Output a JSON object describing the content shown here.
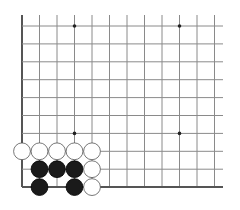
{
  "board": {
    "columns": 12,
    "rows": 10,
    "origin_x": 22,
    "origin_y": 26,
    "spacing_x": 17.5,
    "spacing_y": 17.9,
    "top_extend_y": 15,
    "right_extend_x": 223,
    "edges": {
      "left": true,
      "bottom": true,
      "top": false,
      "right": false
    },
    "line_color": "#8a8a8a",
    "edge_color": "#555555",
    "star_points": [
      {
        "col": 3,
        "row": 0
      },
      {
        "col": 9,
        "row": 0
      },
      {
        "col": 3,
        "row": 6
      },
      {
        "col": 9,
        "row": 6
      }
    ]
  },
  "stones": [
    {
      "color": "white",
      "col": 0,
      "row": 7
    },
    {
      "color": "white",
      "col": 1,
      "row": 7
    },
    {
      "color": "white",
      "col": 2,
      "row": 7
    },
    {
      "color": "white",
      "col": 3,
      "row": 7
    },
    {
      "color": "white",
      "col": 4,
      "row": 7
    },
    {
      "color": "black",
      "col": 1,
      "row": 8
    },
    {
      "color": "black",
      "col": 2,
      "row": 8
    },
    {
      "color": "black",
      "col": 3,
      "row": 8
    },
    {
      "color": "white",
      "col": 4,
      "row": 8
    },
    {
      "color": "black",
      "col": 1,
      "row": 9
    },
    {
      "color": "black",
      "col": 3,
      "row": 9
    },
    {
      "color": "white",
      "col": 4,
      "row": 9
    }
  ],
  "colors": {
    "black_stone": "#1a1a1a",
    "white_stone": "#ffffff",
    "white_stone_border": "#555555"
  }
}
